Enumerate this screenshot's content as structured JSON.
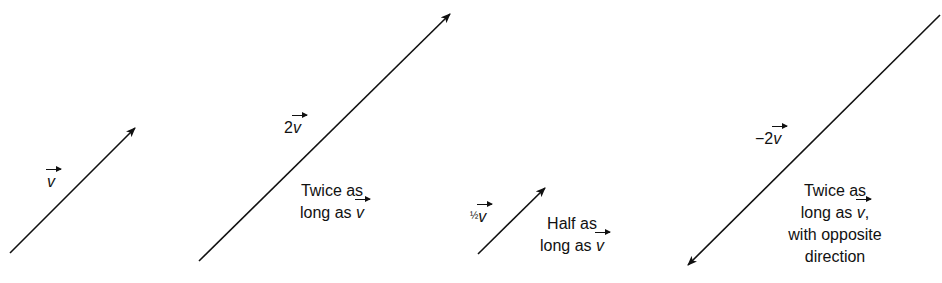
{
  "figure": {
    "vectors": [
      {
        "id": "v",
        "label_coeff": "",
        "label_var": "v",
        "from": [
          10,
          253
        ],
        "to": [
          135,
          128
        ],
        "caption_lines": []
      },
      {
        "id": "2v",
        "label_coeff": "2",
        "label_var": "v",
        "from": [
          199,
          261
        ],
        "to": [
          450,
          14
        ],
        "caption_lines": [
          "Twice as",
          "long as"
        ],
        "caption_var": "v"
      },
      {
        "id": "half-v",
        "label_coeff": "½",
        "label_var": "v",
        "from": [
          478,
          254
        ],
        "to": [
          545,
          188
        ],
        "caption_lines": [
          "Half as",
          "long as"
        ],
        "caption_var": "v"
      },
      {
        "id": "neg-2v",
        "label_coeff": "−2",
        "label_var": "v",
        "from": [
          940,
          15
        ],
        "to": [
          688,
          265
        ],
        "caption_lines": [
          "Twice as",
          "long as",
          "with opposite",
          "direction"
        ],
        "caption_var": "v"
      }
    ],
    "labels": {
      "v": {
        "var": "v"
      },
      "two_v": {
        "coeff": "2",
        "var": "v"
      },
      "half_v": {
        "coeff": "½",
        "var": "v"
      },
      "neg_two_v": {
        "coeff": "−2",
        "var": "v"
      }
    },
    "captions": {
      "two_v": {
        "line1": "Twice as",
        "line2": "long as",
        "var": "v"
      },
      "half_v": {
        "line1": "Half as",
        "line2": "long as",
        "var": "v"
      },
      "neg_two_v": {
        "line1": "Twice as",
        "line2": "long as",
        "var": "v",
        "comma": ",",
        "line3": "with opposite",
        "line4": "direction"
      }
    },
    "colors": {
      "ink": "#111111",
      "background": "#ffffff"
    }
  }
}
